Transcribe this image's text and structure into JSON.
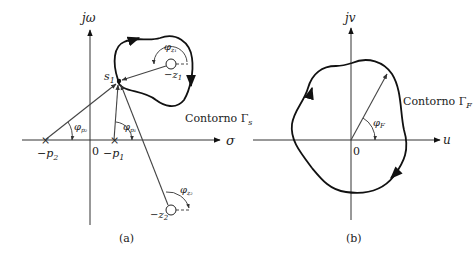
{
  "panel_a": {
    "caption": "(a)",
    "vertical_axis_label": "jω",
    "horizontal_axis_label": "σ",
    "origin_label": "0",
    "point_label": "s",
    "point_sub": "1",
    "contour_label": "Contorno Γ",
    "contour_sub": "s",
    "poles": [
      {
        "label": "−p",
        "sub": "2",
        "angle": "φ",
        "angle_sub": "p₂"
      },
      {
        "label": "−p",
        "sub": "1",
        "angle": "φ",
        "angle_sub": "p₁"
      }
    ],
    "zeros": [
      {
        "label": "−z",
        "sub": "1",
        "angle": "φ",
        "angle_sub": "z₁"
      },
      {
        "label": "−z",
        "sub": "2",
        "angle": "φ",
        "angle_sub": "z₂"
      }
    ]
  },
  "panel_b": {
    "caption": "(b)",
    "vertical_axis_label": "jv",
    "horizontal_axis_label": "u",
    "origin_label": "0",
    "contour_label": "Contorno Γ",
    "contour_sub": "F",
    "angle": "φ",
    "angle_sub": "F"
  }
}
